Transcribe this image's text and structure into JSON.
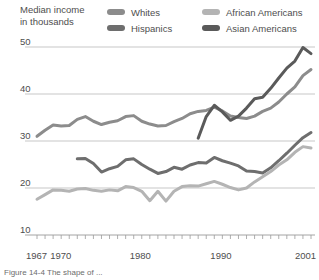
{
  "axis_title": {
    "line1": "Median income",
    "line2": "in thousands"
  },
  "legend": {
    "items": [
      {
        "label": "Whites",
        "color": "#8c8c8c"
      },
      {
        "label": "Hispanics",
        "color": "#6e6e6e"
      },
      {
        "label": "African Americans",
        "color": "#b4b4b4"
      },
      {
        "label": "Asian Americans",
        "color": "#5a5a5a"
      }
    ]
  },
  "caption": {
    "text": "Figure 14-4  The shape of ..."
  },
  "chart_data": {
    "type": "line",
    "title": "Median income in thousands",
    "xlabel": "",
    "ylabel": "Median income in thousands",
    "xlim": [
      1967,
      2001
    ],
    "ylim": [
      10,
      52
    ],
    "yticks": [
      10,
      20,
      30,
      40,
      50
    ],
    "ytick_labels": [
      "10",
      "20",
      "30",
      "40",
      "50"
    ],
    "xticks": [
      1967,
      1970,
      1980,
      1990,
      2001
    ],
    "xtick_labels": [
      "1967",
      "1970",
      "1980",
      "1990",
      "2001"
    ],
    "minor_xticks": "every year from 1967 to 2001",
    "grid": "horizontal gridlines at 20, 30, 40, 50",
    "legend_position": "top",
    "series": [
      {
        "name": "Whites",
        "color": "#8c8c8c",
        "x": [
          1967,
          1968,
          1969,
          1970,
          1971,
          1972,
          1973,
          1974,
          1975,
          1976,
          1977,
          1978,
          1979,
          1980,
          1981,
          1982,
          1983,
          1984,
          1985,
          1986,
          1987,
          1988,
          1989,
          1990,
          1991,
          1992,
          1993,
          1994,
          1995,
          1996,
          1997,
          1998,
          1999,
          2000,
          2001
        ],
        "values": [
          31.0,
          32.3,
          33.4,
          33.2,
          33.3,
          34.6,
          35.2,
          34.2,
          33.5,
          34.0,
          34.3,
          35.2,
          35.4,
          34.2,
          33.6,
          33.2,
          33.3,
          34.1,
          34.8,
          35.8,
          36.3,
          36.5,
          37.2,
          36.4,
          35.3,
          35.0,
          34.8,
          35.3,
          36.3,
          37.0,
          38.3,
          40.0,
          41.5,
          43.9,
          45.2
        ]
      },
      {
        "name": "Hispanics",
        "color": "#6e6e6e",
        "x": [
          1972,
          1973,
          1974,
          1975,
          1976,
          1977,
          1978,
          1979,
          1980,
          1981,
          1982,
          1983,
          1984,
          1985,
          1986,
          1987,
          1988,
          1989,
          1990,
          1991,
          1992,
          1993,
          1994,
          1995,
          1996,
          1997,
          1998,
          1999,
          2000,
          2001
        ],
        "values": [
          26.2,
          26.3,
          25.2,
          23.4,
          24.1,
          24.6,
          26.0,
          26.2,
          25.0,
          24.0,
          23.1,
          23.5,
          24.4,
          24.0,
          24.9,
          25.4,
          25.3,
          26.5,
          25.8,
          25.3,
          24.7,
          23.6,
          23.5,
          23.2,
          24.3,
          25.8,
          27.4,
          29.1,
          30.7,
          31.8
        ]
      },
      {
        "name": "African Americans",
        "color": "#b4b4b4",
        "x": [
          1967,
          1968,
          1969,
          1970,
          1971,
          1972,
          1973,
          1974,
          1975,
          1976,
          1977,
          1978,
          1979,
          1980,
          1981,
          1982,
          1983,
          1984,
          1985,
          1986,
          1987,
          1988,
          1989,
          1990,
          1991,
          1992,
          1993,
          1994,
          1995,
          1996,
          1997,
          1998,
          1999,
          2000,
          2001
        ],
        "values": [
          17.6,
          18.6,
          19.6,
          19.5,
          19.3,
          19.8,
          19.9,
          19.5,
          19.3,
          19.6,
          19.4,
          20.3,
          20.1,
          19.3,
          17.3,
          19.3,
          17.2,
          19.3,
          20.3,
          20.5,
          20.4,
          20.9,
          21.4,
          20.8,
          20.1,
          19.6,
          20.0,
          21.3,
          22.4,
          23.5,
          24.9,
          26.0,
          27.6,
          28.8,
          28.5
        ]
      },
      {
        "name": "Asian Americans",
        "color": "#5a5a5a",
        "x": [
          1987,
          1988,
          1989,
          1990,
          1991,
          1992,
          1993,
          1994,
          1995,
          1996,
          1997,
          1998,
          1999,
          2000,
          2001
        ],
        "values": [
          30.6,
          35.2,
          37.6,
          36.2,
          34.4,
          35.3,
          37.0,
          39.0,
          39.3,
          41.2,
          43.4,
          45.5,
          47.0,
          49.9,
          48.6
        ]
      }
    ]
  }
}
